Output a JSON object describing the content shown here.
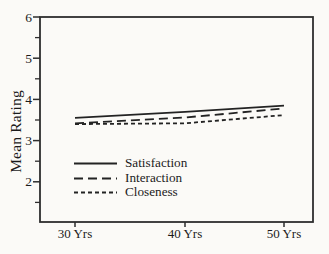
{
  "figure": {
    "background": "#fbfaf7",
    "axis_color": "#2e2e2e",
    "line_color": "#232323",
    "text_color": "#1b1b1b"
  },
  "chart_data": {
    "type": "line",
    "title": "",
    "xlabel": "",
    "ylabel": "Mean Rating",
    "x_tick_labels": [
      "30 Yrs",
      "40 Yrs",
      "50 Yrs"
    ],
    "x_values": [
      30,
      40,
      50
    ],
    "y_ticks": [
      6,
      5,
      4,
      3,
      2
    ],
    "y_minor_ticks": [
      5.5,
      4.5,
      3.5,
      2.5,
      1.5
    ],
    "ylim": [
      1,
      6
    ],
    "grid": false,
    "legend_position": "inside-bottom-left",
    "series": [
      {
        "name": "Satisfaction",
        "dash": "solid",
        "values": [
          3.55,
          3.7,
          3.85
        ]
      },
      {
        "name": "Interaction",
        "dash": "long-dash",
        "values": [
          3.42,
          3.56,
          3.78
        ]
      },
      {
        "name": "Closeness",
        "dash": "short-dash",
        "values": [
          3.4,
          3.42,
          3.62
        ]
      }
    ]
  }
}
